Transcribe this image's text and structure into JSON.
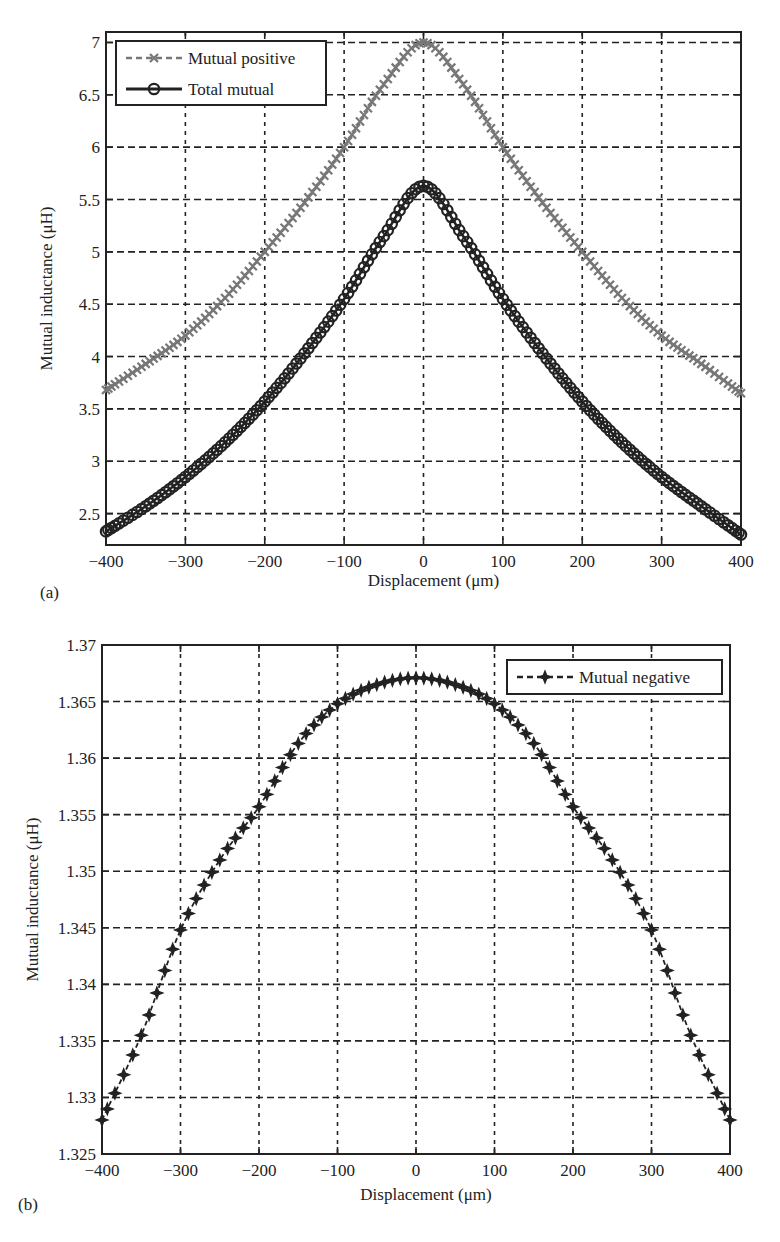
{
  "chart_data": [
    {
      "panel": "(a)",
      "type": "line",
      "title": "",
      "xlabel": "Displacement (μm)",
      "ylabel": "Mutual inductance (μH)",
      "xlim": [
        -400,
        400
      ],
      "ylim": [
        2.2,
        7.1
      ],
      "xticks": [
        -400,
        -300,
        -200,
        -100,
        0,
        100,
        200,
        300,
        400
      ],
      "xtick_labels": [
        "−400",
        "−300",
        "−200",
        "−100",
        "0",
        "100",
        "200",
        "300",
        "400"
      ],
      "yticks": [
        2.5,
        3,
        3.5,
        4,
        4.5,
        5,
        5.5,
        6,
        6.5,
        7
      ],
      "ytick_labels": [
        "2.5",
        "3",
        "3.5",
        "4",
        "4.5",
        "5",
        "5.5",
        "6",
        "6.5",
        "7"
      ],
      "grid": true,
      "legend_position": "upper left",
      "x": [
        -400,
        -350,
        -300,
        -250,
        -200,
        -150,
        -100,
        -50,
        0,
        50,
        100,
        150,
        200,
        250,
        300,
        350,
        400
      ],
      "series": [
        {
          "name": "Mutual positive",
          "style": "dashed",
          "marker": "plus",
          "color": "#777777",
          "values": [
            3.68,
            3.93,
            4.2,
            4.56,
            5.0,
            5.47,
            6.0,
            6.6,
            7.0,
            6.6,
            6.0,
            5.47,
            5.0,
            4.56,
            4.2,
            3.93,
            3.65
          ]
        },
        {
          "name": "Total mutual",
          "style": "solid",
          "marker": "circle",
          "color": "#222222",
          "values": [
            2.33,
            2.57,
            2.85,
            3.18,
            3.57,
            4.03,
            4.55,
            5.15,
            5.63,
            5.15,
            4.55,
            4.03,
            3.57,
            3.18,
            2.85,
            2.57,
            2.3
          ]
        }
      ]
    },
    {
      "panel": "(b)",
      "type": "line",
      "title": "",
      "xlabel": "Displacement (μm)",
      "ylabel": "Mutual inductance (μH)",
      "xlim": [
        -400,
        400
      ],
      "ylim": [
        1.325,
        1.37
      ],
      "xticks": [
        -400,
        -300,
        -200,
        -100,
        0,
        100,
        200,
        300,
        400
      ],
      "xtick_labels": [
        "−400",
        "−300",
        "−200",
        "−100",
        "0",
        "100",
        "200",
        "300",
        "400"
      ],
      "yticks": [
        1.325,
        1.33,
        1.335,
        1.34,
        1.345,
        1.35,
        1.355,
        1.36,
        1.365,
        1.37
      ],
      "ytick_labels": [
        "1.325",
        "1.33",
        "1.335",
        "1.34",
        "1.345",
        "1.35",
        "1.355",
        "1.36",
        "1.365",
        "1.37"
      ],
      "grid": true,
      "legend_position": "upper right",
      "x": [
        -400,
        -350,
        -300,
        -250,
        -200,
        -150,
        -100,
        -50,
        0,
        50,
        100,
        150,
        200,
        250,
        300,
        350,
        400
      ],
      "series": [
        {
          "name": "Mutual negative",
          "style": "dashed",
          "marker": "star",
          "color": "#222222",
          "values": [
            1.328,
            1.3355,
            1.3448,
            1.351,
            1.3557,
            1.3613,
            1.3648,
            1.3665,
            1.3671,
            1.3665,
            1.3648,
            1.3613,
            1.3557,
            1.351,
            1.3448,
            1.3355,
            1.328
          ]
        }
      ]
    }
  ]
}
